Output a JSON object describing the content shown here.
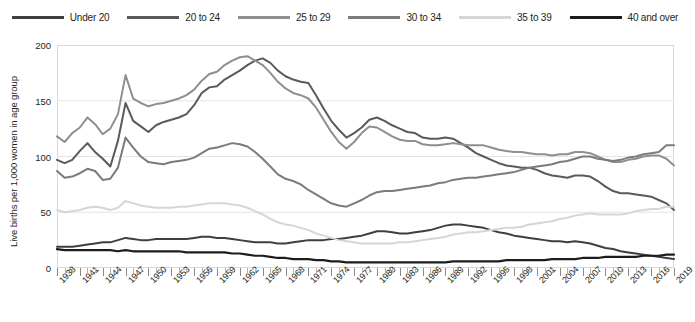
{
  "chart_data": {
    "type": "line",
    "title": "",
    "xlabel": "",
    "ylabel": "Live births per 1,000 women in age group",
    "ylim": [
      0,
      200
    ],
    "yticks": [
      0,
      50,
      100,
      150,
      200
    ],
    "xlim": [
      1938,
      2019
    ],
    "xtick_step": 3,
    "grid": "horizontal",
    "legend_position": "top-center",
    "x": [
      1938,
      1939,
      1940,
      1941,
      1942,
      1943,
      1944,
      1945,
      1946,
      1947,
      1948,
      1949,
      1950,
      1951,
      1952,
      1953,
      1954,
      1955,
      1956,
      1957,
      1958,
      1959,
      1960,
      1961,
      1962,
      1963,
      1964,
      1965,
      1966,
      1967,
      1968,
      1969,
      1970,
      1971,
      1972,
      1973,
      1974,
      1975,
      1976,
      1977,
      1978,
      1979,
      1980,
      1981,
      1982,
      1983,
      1984,
      1985,
      1986,
      1987,
      1988,
      1989,
      1990,
      1991,
      1992,
      1993,
      1994,
      1995,
      1996,
      1997,
      1998,
      1999,
      2000,
      2001,
      2002,
      2003,
      2004,
      2005,
      2006,
      2007,
      2008,
      2009,
      2010,
      2011,
      2012,
      2013,
      2014,
      2015,
      2016,
      2017,
      2018,
      2019
    ],
    "xtick_labels": [
      "1938",
      "1941",
      "1944",
      "1947",
      "1950",
      "1953",
      "1956",
      "1959",
      "1962",
      "1965",
      "1968",
      "1971",
      "1974",
      "1977",
      "1980",
      "1983",
      "1986",
      "1989",
      "1992",
      "1995",
      "1998",
      "2001",
      "2004",
      "2007",
      "2010",
      "2013",
      "2016",
      "2019"
    ],
    "series": [
      {
        "name": "Under 20",
        "color": "#3f3f3f",
        "width": 2.0,
        "values": [
          19,
          19,
          19,
          20,
          21,
          22,
          23,
          23,
          25,
          27,
          26,
          25,
          25,
          26,
          26,
          26,
          26,
          26,
          27,
          28,
          28,
          27,
          27,
          26,
          25,
          24,
          23,
          23,
          23,
          22,
          22,
          23,
          24,
          25,
          25,
          25,
          26,
          26,
          27,
          28,
          29,
          31,
          33,
          33,
          32,
          31,
          31,
          32,
          33,
          34,
          36,
          38,
          39,
          39,
          38,
          37,
          36,
          34,
          32,
          31,
          29,
          28,
          27,
          26,
          25,
          24,
          24,
          23,
          24,
          23,
          22,
          20,
          18,
          17,
          15,
          14,
          13,
          12,
          11,
          10,
          9,
          8
        ]
      },
      {
        "name": "20 to 24",
        "color": "#5a5a5a",
        "width": 2.0,
        "values": [
          97,
          94,
          97,
          105,
          112,
          104,
          98,
          91,
          114,
          148,
          132,
          127,
          122,
          128,
          131,
          133,
          135,
          138,
          146,
          157,
          162,
          163,
          169,
          173,
          177,
          182,
          186,
          188,
          184,
          177,
          172,
          169,
          167,
          166,
          155,
          143,
          132,
          124,
          117,
          121,
          126,
          133,
          135,
          132,
          128,
          125,
          122,
          121,
          117,
          116,
          116,
          117,
          116,
          112,
          108,
          103,
          100,
          97,
          94,
          92,
          91,
          90,
          90,
          88,
          85,
          83,
          82,
          81,
          83,
          83,
          82,
          78,
          73,
          69,
          67,
          67,
          66,
          65,
          64,
          61,
          58,
          52
        ]
      },
      {
        "name": "25 to 29",
        "color": "#8f8f8f",
        "width": 2.0,
        "values": [
          118,
          113,
          121,
          126,
          135,
          129,
          120,
          125,
          138,
          173,
          152,
          148,
          145,
          147,
          148,
          150,
          152,
          155,
          160,
          168,
          174,
          176,
          182,
          186,
          189,
          190,
          186,
          182,
          175,
          167,
          161,
          157,
          155,
          152,
          144,
          133,
          122,
          113,
          107,
          113,
          121,
          127,
          126,
          122,
          118,
          115,
          114,
          114,
          111,
          110,
          110,
          111,
          112,
          111,
          110,
          110,
          110,
          108,
          106,
          105,
          104,
          104,
          103,
          102,
          102,
          101,
          102,
          102,
          104,
          104,
          103,
          100,
          97,
          95,
          95,
          97,
          98,
          100,
          101,
          101,
          98,
          92
        ]
      },
      {
        "name": "30 to 34",
        "color": "#7b7b7b",
        "width": 2.0,
        "values": [
          87,
          81,
          82,
          85,
          89,
          87,
          79,
          80,
          90,
          117,
          108,
          100,
          95,
          94,
          93,
          95,
          96,
          97,
          99,
          103,
          107,
          108,
          110,
          112,
          111,
          109,
          104,
          98,
          91,
          84,
          80,
          78,
          75,
          70,
          66,
          62,
          58,
          56,
          55,
          58,
          61,
          65,
          68,
          69,
          69,
          70,
          71,
          72,
          73,
          74,
          76,
          77,
          79,
          80,
          81,
          81,
          82,
          83,
          84,
          85,
          86,
          88,
          90,
          91,
          92,
          93,
          95,
          96,
          98,
          100,
          100,
          98,
          97,
          96,
          97,
          99,
          100,
          102,
          103,
          104,
          110,
          110
        ]
      },
      {
        "name": "35 to 39",
        "color": "#d6d6d6",
        "width": 2.0,
        "values": [
          52,
          50,
          51,
          52,
          54,
          55,
          54,
          52,
          54,
          60,
          58,
          56,
          55,
          54,
          54,
          54,
          55,
          55,
          56,
          57,
          58,
          58,
          58,
          57,
          56,
          54,
          51,
          48,
          44,
          41,
          39,
          38,
          36,
          34,
          31,
          29,
          27,
          25,
          24,
          23,
          22,
          22,
          22,
          22,
          22,
          23,
          23,
          24,
          25,
          26,
          27,
          28,
          30,
          31,
          32,
          32,
          33,
          34,
          35,
          36,
          36,
          37,
          39,
          40,
          41,
          42,
          44,
          45,
          47,
          48,
          49,
          48,
          48,
          48,
          48,
          49,
          51,
          52,
          53,
          53,
          55,
          55
        ]
      },
      {
        "name": "40 and over",
        "color": "#1c1c1c",
        "width": 2.2,
        "values": [
          17,
          16,
          16,
          16,
          16,
          16,
          16,
          16,
          15,
          16,
          15,
          15,
          15,
          15,
          15,
          15,
          15,
          14,
          14,
          14,
          14,
          14,
          14,
          13,
          13,
          12,
          11,
          11,
          10,
          9,
          9,
          8,
          8,
          8,
          7,
          7,
          6,
          6,
          5,
          5,
          5,
          5,
          5,
          5,
          5,
          5,
          5,
          5,
          5,
          5,
          5,
          5,
          6,
          6,
          6,
          6,
          6,
          6,
          6,
          7,
          7,
          7,
          7,
          7,
          7,
          8,
          8,
          8,
          8,
          9,
          9,
          9,
          10,
          10,
          10,
          10,
          10,
          11,
          11,
          11,
          12,
          12
        ]
      }
    ]
  },
  "legend": {
    "items": [
      {
        "label": "Under 20",
        "color": "#3f3f3f"
      },
      {
        "label": "20 to 24",
        "color": "#5a5a5a"
      },
      {
        "label": "25 to 29",
        "color": "#8f8f8f"
      },
      {
        "label": "30 to 34",
        "color": "#7b7b7b"
      },
      {
        "label": "35 to 39",
        "color": "#d6d6d6"
      },
      {
        "label": "40 and over",
        "color": "#1c1c1c"
      }
    ]
  },
  "axes": {
    "y_title": "Live births per 1,000 women in age group",
    "y_labels": [
      "0",
      "50",
      "100",
      "150",
      "200"
    ]
  }
}
